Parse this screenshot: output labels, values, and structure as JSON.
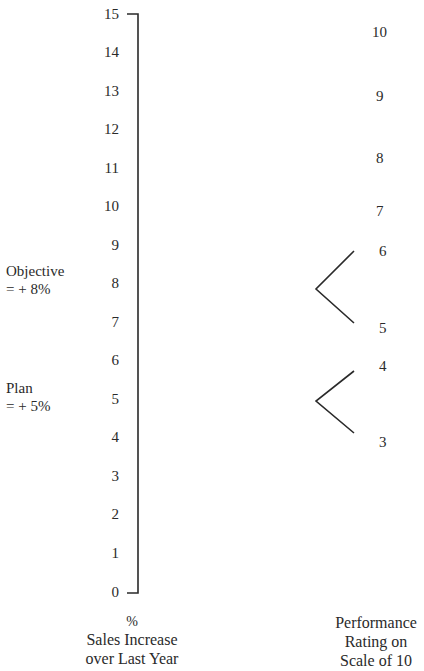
{
  "left_scale": {
    "ticks": [
      "15",
      "14",
      "13",
      "12",
      "11",
      "10",
      "9",
      "8",
      "7",
      "6",
      "5",
      "4",
      "3",
      "2",
      "1",
      "0"
    ],
    "unit": "%",
    "caption_line1": "Sales Increase",
    "caption_line2": "over Last Year"
  },
  "annotations": {
    "objective_label": "Objective",
    "objective_value": "= + 8%",
    "plan_label": "Plan",
    "plan_value": "= + 5%"
  },
  "right_scale": {
    "ticks": [
      "10",
      "9",
      "8",
      "7",
      "6",
      "5",
      "4",
      "3"
    ],
    "caption_line1": "Performance",
    "caption_line2": "Rating on",
    "caption_line3": "Scale of 10"
  },
  "mappings": [
    {
      "from_percent": "8",
      "to_ratings": [
        "6",
        "5"
      ]
    },
    {
      "from_percent": "5",
      "to_ratings": [
        "4",
        "3"
      ]
    }
  ],
  "colors": {
    "line": "#2a2a2a",
    "text": "#2a2a2a",
    "background": "#ffffff"
  }
}
